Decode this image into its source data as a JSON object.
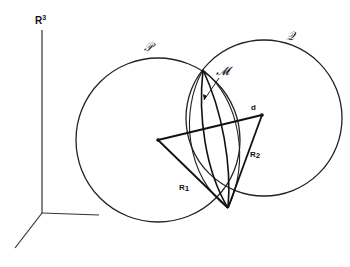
{
  "figure": {
    "type": "geometric-diagram",
    "space_label": "R",
    "space_exponent": "3",
    "circles": [
      {
        "id": "P",
        "label": "𝒫",
        "center": [
          158,
          140
        ],
        "radius": 82
      },
      {
        "id": "Q",
        "label": "𝒬",
        "center": [
          264,
          118
        ],
        "radius": 78
      }
    ],
    "intersection_label": "𝓜",
    "segment_labels": {
      "d": "d",
      "r1": "R",
      "r1_sub": "1",
      "r2": "R",
      "r2_sub": "2"
    },
    "colors": {
      "ink": "#111111",
      "background": "#ffffff"
    }
  }
}
